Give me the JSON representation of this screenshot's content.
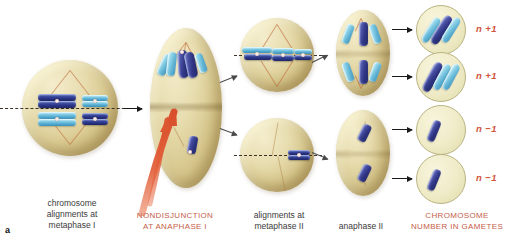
{
  "figure": {
    "panel_letter": "a",
    "accent_color": "#c4604a",
    "ploidy_color": "#d1553c",
    "cell_color": "#e0d29c",
    "chromosome_colors": {
      "dark": "#2f3582",
      "light": "#6cc0da"
    }
  },
  "captions": [
    {
      "id": "metaphase-i",
      "text": "chromosome\nalignments at\nmetaphase I",
      "accent": false
    },
    {
      "id": "nondisjunction",
      "text": "NONDISJUNCTION\nAT ANAPHASE I",
      "accent": true
    },
    {
      "id": "metaphase-ii",
      "text": "alignments at\nmetaphase II",
      "accent": false
    },
    {
      "id": "anaphase-ii",
      "text": "anaphase II",
      "accent": false
    },
    {
      "id": "gametes",
      "text": "CHROMOSOME\nNUMBER IN GAMETES",
      "accent": true
    }
  ],
  "stages": [
    {
      "id": "metaphase-i",
      "label": "metaphase I cell",
      "chromosome_count": 4
    },
    {
      "id": "anaphase-i",
      "label": "anaphase I cell nondisjunction",
      "chromosome_count": 4
    },
    {
      "id": "metaphase-ii-top",
      "label": "metaphase II cell upper",
      "chromosome_count": 3
    },
    {
      "id": "metaphase-ii-bot",
      "label": "metaphase II cell lower",
      "chromosome_count": 1
    },
    {
      "id": "anaphase-ii-top",
      "label": "anaphase II cell upper",
      "chromosome_count": 6
    },
    {
      "id": "anaphase-ii-bot",
      "label": "anaphase II cell lower",
      "chromosome_count": 2
    }
  ],
  "gametes": [
    {
      "id": "gamete-1",
      "ploidy": "n +1",
      "chromosome_count": 3
    },
    {
      "id": "gamete-2",
      "ploidy": "n +1",
      "chromosome_count": 3
    },
    {
      "id": "gamete-3",
      "ploidy": "n −1",
      "chromosome_count": 1
    },
    {
      "id": "gamete-4",
      "ploidy": "n −1",
      "chromosome_count": 1
    }
  ]
}
